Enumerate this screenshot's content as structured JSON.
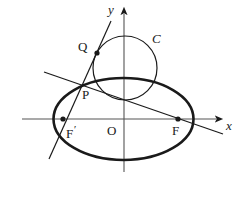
{
  "figure": {
    "kind": "geometry-diagram",
    "background_color": "#ffffff",
    "stroke_color": "#1a1a1a",
    "axes": {
      "x_label": "x",
      "y_label": "y",
      "origin_label": "O",
      "x_axis": {
        "x1": 22,
        "y1": 119,
        "x2": 222,
        "y2": 119,
        "arrow": "right"
      },
      "y_axis": {
        "x1": 124,
        "y1": 172,
        "x2": 124,
        "y2": 8,
        "arrow": "up"
      },
      "origin": {
        "x": 124,
        "y": 119
      }
    },
    "ellipse": {
      "name": "ellipse",
      "cx": 123.5,
      "cy": 119,
      "rx": 70,
      "ry": 41,
      "stroke_width": 2.6
    },
    "circle": {
      "name": "circle-C",
      "label": "C",
      "cx": 125,
      "cy": 68,
      "r": 32,
      "stroke_width": 1.2
    },
    "lines": [
      {
        "name": "steep-secant-line",
        "x1": 111,
        "y1": 21,
        "x2": 49,
        "y2": 159,
        "stroke_width": 1.2
      },
      {
        "name": "shallow-chord-line",
        "x1": 44,
        "y1": 72,
        "x2": 223,
        "y2": 134,
        "stroke_width": 1.2
      }
    ],
    "points": [
      {
        "name": "point-Q",
        "label": "Q",
        "x": 97,
        "y": 53,
        "r": 2.6,
        "label_x": 78,
        "label_y": 40
      },
      {
        "name": "point-P",
        "label": "P",
        "x": 85.5,
        "y": 81,
        "r": 0,
        "label_x": 82,
        "label_y": 88
      },
      {
        "name": "point-F-prime",
        "label": "F",
        "prime": "′",
        "x": 63,
        "y": 119,
        "r": 2.6,
        "label_x": 66,
        "label_y": 124
      },
      {
        "name": "point-F",
        "label": "F",
        "prime": "",
        "x": 178,
        "y": 119,
        "r": 2.6,
        "label_x": 172,
        "label_y": 124
      }
    ],
    "labels": {
      "y_label_x": 108,
      "y_label_y": 4,
      "x_label_x": 226,
      "x_label_y": 119,
      "origin_label_x": 107,
      "origin_label_y": 124,
      "circle_label_x": 152,
      "circle_label_y": 33
    }
  }
}
